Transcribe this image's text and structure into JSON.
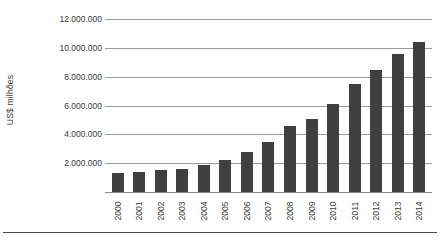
{
  "chart_data": {
    "type": "bar",
    "title": "",
    "subtitle": "",
    "xlabel": "",
    "ylabel": "US$ milhões",
    "categories": [
      "2000",
      "2001",
      "2002",
      "2003",
      "2004",
      "2005",
      "2006",
      "2007",
      "2008",
      "2009",
      "2010",
      "2011",
      "2012",
      "2013",
      "2014"
    ],
    "values": [
      1300000,
      1400000,
      1500000,
      1600000,
      1900000,
      2250000,
      2800000,
      3500000,
      4550000,
      5050000,
      6100000,
      7500000,
      8450000,
      9550000,
      10400000
    ],
    "ylim": [
      0,
      12000000
    ],
    "ytick_labels": [
      "12.000.000",
      "10.000.000",
      "8.000.000",
      "6.000.000",
      "4.000.000",
      "2.000.000"
    ],
    "ytick_values": [
      12000000,
      10000000,
      8000000,
      6000000,
      4000000,
      2000000
    ],
    "grid": true,
    "legend": "none",
    "bar_color": "#3f3f3f",
    "gridline_color": "#9a9a9a",
    "background_color": "#ffffff"
  }
}
